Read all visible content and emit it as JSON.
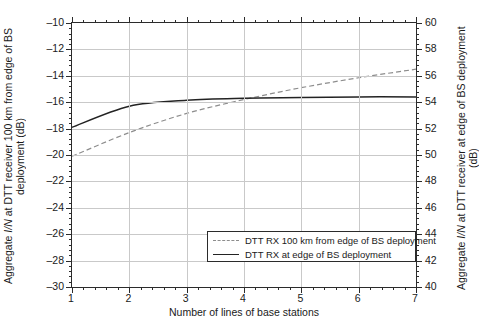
{
  "chart_data": {
    "type": "line",
    "title": "",
    "xlabel": "Number of lines of base stations",
    "ylabel": "Aggregate I/N at DTT receiver 100 km from edge of BS deployment (dB)",
    "ylabel_right": "Aggregate I/N at DTT receiver at edge of BS deployment (dB)",
    "xlim": [
      1,
      7
    ],
    "ylim": [
      -30,
      -10
    ],
    "ylim_right": [
      40,
      60
    ],
    "grid": true,
    "legend_position": "lower right",
    "xticks": [
      "1",
      "2",
      "3",
      "4",
      "5",
      "6",
      "7"
    ],
    "yticks_left": [
      "-10",
      "-12",
      "-14",
      "-16",
      "-18",
      "-20",
      "-22",
      "-24",
      "-26",
      "-28",
      "-30"
    ],
    "yticks_right": [
      "60",
      "58",
      "56",
      "54",
      "52",
      "50",
      "48",
      "46",
      "44",
      "42",
      "40"
    ],
    "x": [
      1,
      2,
      3,
      4,
      5,
      6,
      7
    ],
    "series": [
      {
        "name": "DTT RX 100 km from edge of BS deployment",
        "style": "dashed",
        "color": "#8d8d8d",
        "values": [
          -20.1,
          -18.3,
          -16.85,
          -15.8,
          -14.9,
          -14.15,
          -13.5
        ]
      },
      {
        "name": "DTT RX at edge of BS deployment",
        "style": "solid",
        "color": "#232323",
        "values": [
          -17.9,
          -16.3,
          -15.85,
          -15.7,
          -15.65,
          -15.6,
          -15.6
        ]
      }
    ]
  },
  "axes": {
    "x_title": "Number of lines of base stations",
    "y_left_title_part1": "Aggregate ",
    "y_left_title_italic": "I/N",
    "y_left_title_part2": " at DTT receiver 100 km from edge of BS deployment (dB)",
    "y_right_title_part1": "Aggregate ",
    "y_right_title_italic": "I/N",
    "y_right_title_part2": " at DTT receiver at edge of BS deployment (dB)"
  },
  "legend": {
    "items": [
      {
        "label": "DTT RX 100 km from edge of BS deployment",
        "style": "dashed"
      },
      {
        "label": "DTT RX at edge of BS deployment",
        "style": "solid"
      }
    ]
  },
  "colors": {
    "axis": "#2b2b2b",
    "grid": "#c9c9c9",
    "series_dashed": "#8d8d8d",
    "series_solid": "#232323",
    "background": "#ffffff"
  }
}
